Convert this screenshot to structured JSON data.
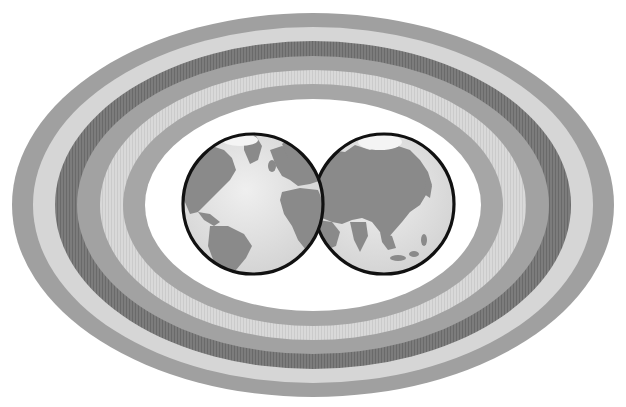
{
  "image": {
    "width": 626,
    "height": 407,
    "background": "#ffffff",
    "description": "Two overlapping hemisphere globes inside concentric gray elliptical rings"
  },
  "rings": {
    "center": [
      313,
      205
    ],
    "bands": [
      {
        "name": "ring-1-outer",
        "rx": 301,
        "ry": 192,
        "color": "#a0a0a0"
      },
      {
        "name": "ring-2",
        "rx": 278,
        "ry": 177,
        "color": "#d6d6d6"
      },
      {
        "name": "ring-3",
        "rx": 256,
        "ry": 162,
        "color": "#7c7c7c"
      },
      {
        "name": "ring-4",
        "rx": 235,
        "ry": 148,
        "color": "#a2a2a2"
      },
      {
        "name": "ring-5",
        "rx": 212,
        "ry": 134,
        "color": "#d9d9d9"
      },
      {
        "name": "ring-6-inner",
        "rx": 190,
        "ry": 120,
        "color": "#a6a6a6"
      },
      {
        "name": "center-field",
        "rx": 168,
        "ry": 106,
        "color": "#ffffff"
      }
    ]
  },
  "globes": {
    "outline_color": "#111111",
    "ocean_color": "#e2e2e2",
    "land_color": "#8a8a8a",
    "left": {
      "label": "Western hemisphere (Americas, Europe, Africa)",
      "cx": 253,
      "cy": 204,
      "r": 70
    },
    "right": {
      "label": "Eastern hemisphere (Asia)",
      "cx": 384,
      "cy": 204,
      "r": 70
    }
  }
}
